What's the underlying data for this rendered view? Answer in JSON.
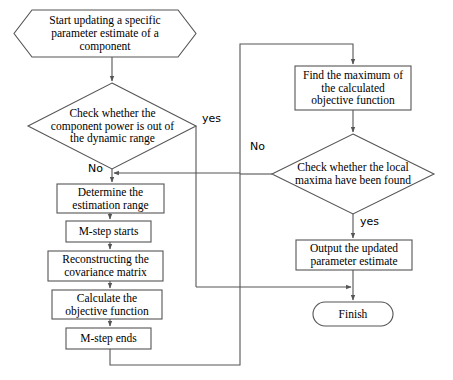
{
  "diagram": {
    "stroke_color": "#555555",
    "text_color": "#000000",
    "background": "#ffffff",
    "nodes": {
      "start": {
        "shape": "hexagon",
        "text": "Start updating a specific\nparameter estimate of a\ncomponent"
      },
      "decision_power": {
        "shape": "diamond",
        "text": "Check whether the\ncomponent power is out of\nthe dynamic range"
      },
      "determine_range": {
        "shape": "rectangle",
        "text": "Determine the\nestimation range"
      },
      "mstep_starts": {
        "shape": "rectangle",
        "text": "M-step starts"
      },
      "reconstruct_cov": {
        "shape": "rectangle",
        "text": "Reconstructing the\ncovariance matrix"
      },
      "calculate_objective": {
        "shape": "rectangle",
        "text": "Calculate the\nobjective function"
      },
      "mstep_ends": {
        "shape": "rectangle",
        "text": "M-step ends"
      },
      "find_maximum": {
        "shape": "rectangle",
        "text": "Find the maximum of\nthe calculated\nobjective function"
      },
      "decision_maxima": {
        "shape": "diamond",
        "text": "Check whether the local\nmaxima have been found"
      },
      "output_estimate": {
        "shape": "rectangle",
        "text": "Output the updated\nparameter estimate"
      },
      "finish": {
        "shape": "rounded-rectangle",
        "text": "Finish"
      }
    },
    "edge_labels": {
      "power_yes": "yes",
      "power_no": "No",
      "maxima_no": "No",
      "maxima_yes": "yes"
    }
  }
}
